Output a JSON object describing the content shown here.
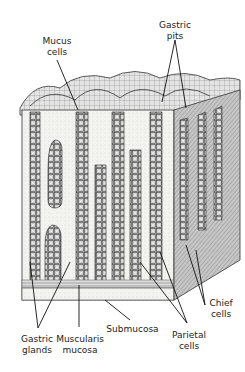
{
  "diagram": {
    "labels": {
      "mucus_cells": [
        "Mucus",
        "cells"
      ],
      "gastric_pits": [
        "Gastric",
        "pits"
      ],
      "chief_cells": [
        "Chief",
        "cells"
      ],
      "parietal_cells": [
        "Parietal",
        "cells"
      ],
      "submucosa": [
        "Submucosa"
      ],
      "muscularis_mucosa": [
        "Muscularis",
        "mucosa"
      ],
      "gastric_glands": [
        "Gastric",
        "glands"
      ]
    }
  }
}
